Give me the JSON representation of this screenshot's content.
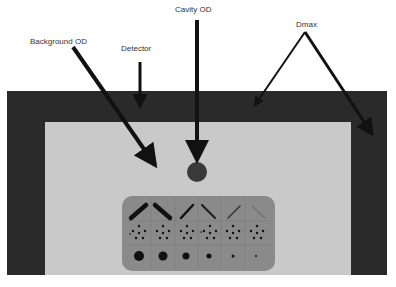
{
  "diagram": {
    "type": "densitometer-measurement-schematic",
    "labels": {
      "background_od": "Background OD",
      "detector": "Detector",
      "cavity_od": "Cavity OD",
      "dmax": "Dmax"
    },
    "colors": {
      "frame": "#2a2a2a",
      "inner_field": "#c9c9c9",
      "panel": "#8a8a8a",
      "arrow": "#111111",
      "cavity_spot": "#3a3a3a"
    },
    "test_panel": {
      "columns": 6,
      "rows": [
        "line-pairs",
        "dot-clusters",
        "single-dots"
      ],
      "line_row": [
        {
          "direction": "rising",
          "weight": 4.5,
          "opacity": 1.0
        },
        {
          "direction": "falling",
          "weight": 4.5,
          "opacity": 1.0
        },
        {
          "direction": "rising",
          "weight": 2.5,
          "opacity": 1.0
        },
        {
          "direction": "falling",
          "weight": 2.0,
          "opacity": 0.9
        },
        {
          "direction": "rising",
          "weight": 1.5,
          "opacity": 0.7
        },
        {
          "direction": "falling",
          "weight": 1.0,
          "opacity": 0.35
        }
      ],
      "single_dot_radii": [
        5,
        4.5,
        3.5,
        2.5,
        1.5,
        1
      ]
    }
  }
}
